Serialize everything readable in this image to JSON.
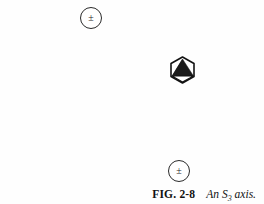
{
  "figure": {
    "background_color": "#fefefe",
    "ink_color": "#232323",
    "caption": {
      "label": "FIG. 2-8",
      "text_before_subscript": "An S",
      "subscript": "3",
      "text_after_subscript": " axis.",
      "full_text": "FIG. 2-8   An S3 axis."
    },
    "markers": [
      {
        "id": "marker-top",
        "glyph": "±",
        "glyph_name": "plus-minus-sign",
        "position": "upper-left"
      },
      {
        "id": "marker-bottom",
        "glyph": "±",
        "glyph_name": "plus-minus-sign",
        "position": "lower-right"
      }
    ],
    "molecule": {
      "outline_shape": "hexagon",
      "inner_shape": "filled-tetrahedron",
      "fill_color": "#1a1a1a",
      "stroke_color": "#121212"
    }
  }
}
